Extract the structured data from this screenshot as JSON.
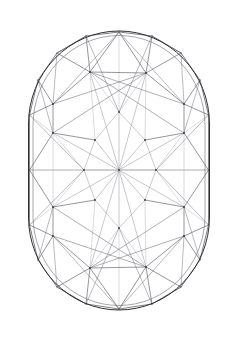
{
  "document": {
    "title": "Gemstone Facet Diagram",
    "subject": "cushion-cut-gemstone-outline",
    "view": "face-up / table view",
    "background_color": "#ffffff"
  },
  "canvas": {
    "width": 235,
    "height": 338
  },
  "style": {
    "outline_color": "#2e2e33",
    "outline_width": 1.0,
    "inner_outline_color": "#6b6b72",
    "inner_outline_width": 0.6,
    "girdle_color": "#4a4a52",
    "girdle_width": 0.7,
    "crown_color": "#5d5d66",
    "crown_width": 0.65,
    "star_color": "#8f8f99",
    "star_width": 0.55,
    "faint_color": "#b6b6be",
    "faint_width": 0.5,
    "fill": "none"
  },
  "geometry": {
    "outer_outline": {
      "name": "girdle-outline",
      "shape": "rounded-rectangle",
      "x": 28.5,
      "y": 31.0,
      "width": 181.0,
      "height": 279.0,
      "rx": 90.5,
      "ry": 93.0
    },
    "inner_outline": {
      "name": "inner-girdle-outline",
      "shape": "rounded-rectangle",
      "x": 33.0,
      "y": 35.5,
      "width": 172.0,
      "height": 270.0,
      "rx": 86.0,
      "ry": 90.0
    },
    "center": {
      "x": 119.0,
      "y": 170.0
    },
    "apex_top": {
      "x": 119.0,
      "y": 32.0
    },
    "apex_bottom": {
      "x": 119.0,
      "y": 309.0
    },
    "edge_left": {
      "x": 29.5,
      "y": 170.0
    },
    "edge_right": {
      "x": 208.5,
      "y": 170.0
    },
    "girdle_vertices": [
      {
        "name": "g-top",
        "x": 119.0,
        "y": 32.0
      },
      {
        "name": "g-tr1",
        "x": 152.0,
        "y": 36.0
      },
      {
        "name": "g-tr2",
        "x": 181.0,
        "y": 53.0
      },
      {
        "name": "g-tr3",
        "x": 200.0,
        "y": 80.0
      },
      {
        "name": "g-r1",
        "x": 208.5,
        "y": 115.0
      },
      {
        "name": "g-r2",
        "x": 208.5,
        "y": 170.0
      },
      {
        "name": "g-r3",
        "x": 208.5,
        "y": 225.0
      },
      {
        "name": "g-br3",
        "x": 200.0,
        "y": 260.0
      },
      {
        "name": "g-br2",
        "x": 181.0,
        "y": 287.0
      },
      {
        "name": "g-br1",
        "x": 152.0,
        "y": 304.0
      },
      {
        "name": "g-bottom",
        "x": 119.0,
        "y": 309.0
      },
      {
        "name": "g-bl1",
        "x": 86.0,
        "y": 304.0
      },
      {
        "name": "g-bl2",
        "x": 57.0,
        "y": 287.0
      },
      {
        "name": "g-bl3",
        "x": 38.0,
        "y": 260.0
      },
      {
        "name": "g-l3",
        "x": 29.5,
        "y": 225.0
      },
      {
        "name": "g-l2",
        "x": 29.5,
        "y": 170.0
      },
      {
        "name": "g-l1",
        "x": 29.5,
        "y": 115.0
      },
      {
        "name": "g-tl3",
        "x": 38.0,
        "y": 80.0
      },
      {
        "name": "g-tl2",
        "x": 57.0,
        "y": 53.0
      },
      {
        "name": "g-tl1",
        "x": 86.0,
        "y": 36.0
      }
    ],
    "crown_vertices": [
      {
        "name": "c-tl-upper",
        "x": 90.0,
        "y": 72.0
      },
      {
        "name": "c-tr-upper",
        "x": 146.0,
        "y": 73.0
      },
      {
        "name": "c-l-upper",
        "x": 53.0,
        "y": 104.0
      },
      {
        "name": "c-r-upper",
        "x": 184.0,
        "y": 104.0
      },
      {
        "name": "c-l-mid",
        "x": 53.0,
        "y": 133.0
      },
      {
        "name": "c-r-mid",
        "x": 184.0,
        "y": 133.0
      },
      {
        "name": "c-l-lower",
        "x": 53.0,
        "y": 207.0
      },
      {
        "name": "c-r-lower",
        "x": 184.0,
        "y": 207.0
      },
      {
        "name": "c-l-bottom",
        "x": 53.0,
        "y": 236.0
      },
      {
        "name": "c-r-bottom",
        "x": 184.0,
        "y": 236.0
      },
      {
        "name": "c-bl-lower",
        "x": 90.0,
        "y": 268.0
      },
      {
        "name": "c-br-lower",
        "x": 146.0,
        "y": 267.0
      }
    ],
    "table_vertices": [
      {
        "name": "t-top",
        "x": 119.0,
        "y": 112.0
      },
      {
        "name": "t-upper-left",
        "x": 95.0,
        "y": 140.0
      },
      {
        "name": "t-upper-right",
        "x": 145.0,
        "y": 140.0
      },
      {
        "name": "t-left",
        "x": 84.0,
        "y": 170.0
      },
      {
        "name": "t-right",
        "x": 156.0,
        "y": 170.0
      },
      {
        "name": "t-lower-left",
        "x": 95.0,
        "y": 200.0
      },
      {
        "name": "t-lower-right",
        "x": 145.0,
        "y": 200.0
      },
      {
        "name": "t-bottom",
        "x": 119.0,
        "y": 228.0
      }
    ]
  },
  "edges": {
    "girdle_polygon": [
      [
        119,
        32,
        152,
        36
      ],
      [
        152,
        36,
        181,
        53
      ],
      [
        181,
        53,
        200,
        80
      ],
      [
        200,
        80,
        208.5,
        115
      ],
      [
        208.5,
        115,
        208.5,
        170
      ],
      [
        208.5,
        170,
        208.5,
        225
      ],
      [
        208.5,
        225,
        200,
        260
      ],
      [
        200,
        260,
        181,
        287
      ],
      [
        181,
        287,
        152,
        304
      ],
      [
        152,
        304,
        119,
        309
      ],
      [
        119,
        309,
        86,
        304
      ],
      [
        86,
        304,
        57,
        287
      ],
      [
        57,
        287,
        38,
        260
      ],
      [
        38,
        260,
        29.5,
        225
      ],
      [
        29.5,
        225,
        29.5,
        170
      ],
      [
        29.5,
        170,
        29.5,
        115
      ],
      [
        29.5,
        115,
        38,
        80
      ],
      [
        38,
        80,
        57,
        53
      ],
      [
        57,
        53,
        86,
        36
      ],
      [
        86,
        36,
        119,
        32
      ]
    ],
    "crown_main": [
      [
        90,
        72,
        146,
        73
      ],
      [
        53,
        104,
        90,
        72
      ],
      [
        146,
        73,
        184,
        104
      ],
      [
        53,
        104,
        53,
        133
      ],
      [
        184,
        104,
        184,
        133
      ],
      [
        53,
        133,
        95,
        140
      ],
      [
        184,
        133,
        145,
        140
      ],
      [
        53,
        207,
        53,
        236
      ],
      [
        184,
        207,
        184,
        236
      ],
      [
        53,
        236,
        90,
        268
      ],
      [
        184,
        236,
        146,
        267
      ],
      [
        90,
        268,
        146,
        267
      ],
      [
        95,
        200,
        53,
        207
      ],
      [
        145,
        200,
        184,
        207
      ],
      [
        119,
        32,
        90,
        72
      ],
      [
        119,
        32,
        146,
        73
      ],
      [
        119,
        309,
        90,
        268
      ],
      [
        119,
        309,
        146,
        267
      ],
      [
        29.5,
        115,
        53,
        104
      ],
      [
        208.5,
        115,
        184,
        104
      ],
      [
        29.5,
        225,
        53,
        236
      ],
      [
        208.5,
        225,
        184,
        236
      ],
      [
        86,
        36,
        90,
        72
      ],
      [
        152,
        36,
        146,
        73
      ],
      [
        86,
        304,
        90,
        268
      ],
      [
        152,
        304,
        146,
        267
      ],
      [
        38,
        80,
        53,
        104
      ],
      [
        200,
        80,
        184,
        104
      ],
      [
        38,
        260,
        53,
        236
      ],
      [
        200,
        260,
        184,
        236
      ],
      [
        29.5,
        170,
        53,
        133
      ],
      [
        29.5,
        170,
        53,
        207
      ],
      [
        208.5,
        170,
        184,
        133
      ],
      [
        208.5,
        170,
        184,
        207
      ],
      [
        57,
        53,
        90,
        72
      ],
      [
        181,
        53,
        146,
        73
      ],
      [
        57,
        287,
        90,
        268
      ],
      [
        181,
        287,
        146,
        267
      ]
    ],
    "crown_long": [
      [
        90,
        72,
        184,
        104
      ],
      [
        146,
        73,
        53,
        104
      ],
      [
        90,
        268,
        184,
        236
      ],
      [
        146,
        267,
        53,
        236
      ],
      [
        53,
        133,
        146,
        73
      ],
      [
        184,
        133,
        90,
        72
      ],
      [
        53,
        207,
        146,
        267
      ],
      [
        184,
        207,
        90,
        268
      ]
    ],
    "table_star": [
      [
        119,
        112,
        95,
        140
      ],
      [
        95,
        140,
        84,
        170
      ],
      [
        84,
        170,
        95,
        200
      ],
      [
        95,
        200,
        119,
        228
      ],
      [
        119,
        228,
        145,
        200
      ],
      [
        145,
        200,
        156,
        170
      ],
      [
        156,
        170,
        145,
        140
      ],
      [
        145,
        140,
        119,
        112
      ]
    ],
    "center_rays": [
      [
        119,
        170,
        119,
        112
      ],
      [
        119,
        170,
        95,
        140
      ],
      [
        119,
        170,
        84,
        170
      ],
      [
        119,
        170,
        95,
        200
      ],
      [
        119,
        170,
        119,
        228
      ],
      [
        119,
        170,
        145,
        200
      ],
      [
        119,
        170,
        156,
        170
      ],
      [
        119,
        170,
        145,
        140
      ],
      [
        119,
        170,
        53,
        133
      ],
      [
        119,
        170,
        184,
        133
      ],
      [
        119,
        170,
        53,
        207
      ],
      [
        119,
        170,
        184,
        207
      ],
      [
        119,
        170,
        29.5,
        170
      ],
      [
        119,
        170,
        208.5,
        170
      ],
      [
        119,
        170,
        90,
        72
      ],
      [
        119,
        170,
        146,
        73
      ],
      [
        119,
        170,
        90,
        268
      ],
      [
        119,
        170,
        146,
        267
      ]
    ],
    "pavilion_faint": [
      [
        119,
        32,
        119,
        112
      ],
      [
        119,
        309,
        119,
        228
      ],
      [
        95,
        140,
        90,
        72
      ],
      [
        145,
        140,
        146,
        73
      ],
      [
        95,
        200,
        90,
        268
      ],
      [
        145,
        200,
        146,
        267
      ],
      [
        84,
        170,
        53,
        133
      ],
      [
        84,
        170,
        53,
        207
      ],
      [
        156,
        170,
        184,
        133
      ],
      [
        156,
        170,
        184,
        207
      ],
      [
        119,
        112,
        90,
        72
      ],
      [
        119,
        112,
        146,
        73
      ],
      [
        119,
        228,
        90,
        268
      ],
      [
        119,
        228,
        146,
        267
      ],
      [
        53,
        133,
        53,
        207
      ],
      [
        184,
        133,
        184,
        207
      ],
      [
        29.5,
        170,
        84,
        170
      ],
      [
        208.5,
        170,
        156,
        170
      ],
      [
        29.5,
        115,
        53,
        133
      ],
      [
        208.5,
        115,
        184,
        133
      ],
      [
        29.5,
        225,
        53,
        207
      ],
      [
        208.5,
        225,
        184,
        207
      ]
    ],
    "crown_spokes": [
      [
        119,
        32,
        53,
        104
      ],
      [
        119,
        32,
        184,
        104
      ],
      [
        119,
        309,
        53,
        236
      ],
      [
        119,
        309,
        184,
        236
      ],
      [
        86,
        36,
        119,
        112
      ],
      [
        152,
        36,
        119,
        112
      ],
      [
        86,
        304,
        119,
        228
      ],
      [
        152,
        304,
        119,
        228
      ],
      [
        57,
        53,
        53,
        104
      ],
      [
        181,
        53,
        184,
        104
      ],
      [
        57,
        287,
        53,
        236
      ],
      [
        181,
        287,
        184,
        236
      ],
      [
        38,
        80,
        53,
        133
      ],
      [
        200,
        80,
        184,
        133
      ],
      [
        38,
        260,
        53,
        207
      ],
      [
        200,
        260,
        184,
        207
      ],
      [
        29.5,
        115,
        84,
        170
      ],
      [
        208.5,
        115,
        156,
        170
      ],
      [
        29.5,
        225,
        84,
        170
      ],
      [
        208.5,
        225,
        156,
        170
      ],
      [
        86,
        36,
        57,
        53
      ],
      [
        152,
        36,
        181,
        53
      ],
      [
        86,
        304,
        57,
        287
      ],
      [
        152,
        304,
        181,
        287
      ]
    ]
  },
  "labels": {
    "caption": "",
    "annotations": []
  }
}
